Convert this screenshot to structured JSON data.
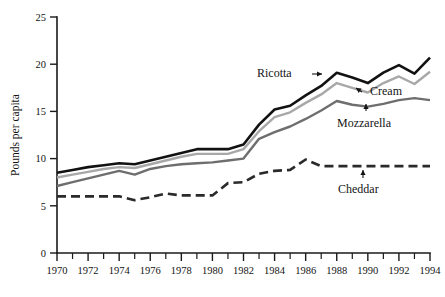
{
  "chart_data": {
    "type": "line",
    "title": "",
    "xlabel": "",
    "ylabel": "Pounds per capita",
    "xlim": [
      1970,
      1994
    ],
    "ylim": [
      0,
      25
    ],
    "ytick_values": [
      0,
      5,
      10,
      15,
      20,
      25
    ],
    "ytick_labels": [
      "0",
      "5",
      "10",
      "15",
      "20",
      "25"
    ],
    "xtick_values": [
      1970,
      1971,
      1972,
      1973,
      1974,
      1975,
      1976,
      1977,
      1978,
      1979,
      1980,
      1981,
      1982,
      1983,
      1984,
      1985,
      1986,
      1987,
      1988,
      1989,
      1990,
      1991,
      1992,
      1993,
      1994
    ],
    "xtick_labels": [
      "1970",
      "",
      "1972",
      "",
      "1974",
      "",
      "1976",
      "",
      "1978",
      "",
      "1980",
      "",
      "1982",
      "",
      "1984",
      "",
      "1986",
      "",
      "1988",
      "",
      "1990",
      "",
      "1992",
      "",
      "1994"
    ],
    "x": [
      1970,
      1971,
      1972,
      1973,
      1974,
      1975,
      1976,
      1977,
      1978,
      1979,
      1980,
      1981,
      1982,
      1983,
      1984,
      1985,
      1986,
      1987,
      1988,
      1989,
      1990,
      1991,
      1992,
      1993,
      1994
    ],
    "grid": false,
    "legend_position": "inline-annotations",
    "series": [
      {
        "name": "Ricotta",
        "color": "#121212",
        "style": "solid",
        "width": 2.6,
        "values": [
          8.5,
          8.8,
          9.1,
          9.3,
          9.5,
          9.4,
          9.8,
          10.2,
          10.6,
          11.0,
          11.0,
          11.0,
          11.5,
          13.6,
          15.2,
          15.6,
          16.7,
          17.7,
          19.1,
          18.6,
          18.0,
          19.1,
          19.9,
          19.0,
          20.7
        ]
      },
      {
        "name": "Cream",
        "color": "#a8a8a8",
        "style": "solid",
        "width": 2.4,
        "values": [
          8.0,
          8.3,
          8.6,
          8.9,
          9.1,
          9.0,
          9.4,
          9.8,
          10.2,
          10.5,
          10.5,
          10.5,
          11.0,
          12.9,
          14.4,
          14.9,
          15.9,
          16.8,
          18.0,
          17.5,
          17.0,
          18.0,
          18.7,
          17.9,
          19.2
        ]
      },
      {
        "name": "Mozzarella",
        "color": "#6e6e6e",
        "style": "solid",
        "width": 2.4,
        "values": [
          7.1,
          7.5,
          7.9,
          8.3,
          8.7,
          8.3,
          8.9,
          9.2,
          9.4,
          9.5,
          9.6,
          9.8,
          10.0,
          12.1,
          12.8,
          13.4,
          14.2,
          15.1,
          16.1,
          15.7,
          15.5,
          15.8,
          16.2,
          16.4,
          16.2
        ]
      },
      {
        "name": "Cheddar",
        "color": "#2a2a2a",
        "style": "dashed",
        "width": 2.6,
        "dash": "9,5",
        "values": [
          6.0,
          6.0,
          6.0,
          6.0,
          6.0,
          5.6,
          5.9,
          6.3,
          6.1,
          6.1,
          6.1,
          7.4,
          7.5,
          8.4,
          8.7,
          8.8,
          9.9,
          9.2,
          9.2,
          9.2,
          9.2,
          9.2,
          9.2,
          9.2,
          9.2
        ]
      }
    ],
    "annotations": [
      {
        "text": "Ricotta",
        "target_series": "Ricotta",
        "arrow": "right",
        "arrow_glyph": "→"
      },
      {
        "text": "Cream",
        "target_series": "Cream",
        "arrow": "up-left",
        "arrow_glyph": "↖"
      },
      {
        "text": "Mozzarella",
        "target_series": "Mozzarella",
        "arrow": "up",
        "arrow_glyph": "↑"
      },
      {
        "text": "Cheddar",
        "target_series": "Cheddar",
        "arrow": "up",
        "arrow_glyph": "↑"
      }
    ]
  }
}
